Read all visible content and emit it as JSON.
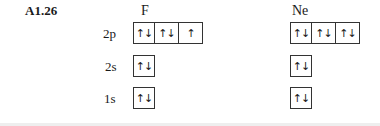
{
  "problem_label": "A1.26",
  "elements": [
    {
      "symbol": "F",
      "orbitals": {
        "2p": [
          "↑↓",
          "↑↓",
          "↑"
        ],
        "2s": [
          "↑↓"
        ],
        "1s": [
          "↑↓"
        ]
      }
    },
    {
      "symbol": "Ne",
      "orbitals": {
        "2p": [
          "↑↓",
          "↑↓",
          "↑↓"
        ],
        "2s": [
          "↑↓"
        ],
        "1s": [
          "↑↓"
        ]
      }
    }
  ],
  "subshell_labels": [
    "2p",
    "2s",
    "1s"
  ]
}
